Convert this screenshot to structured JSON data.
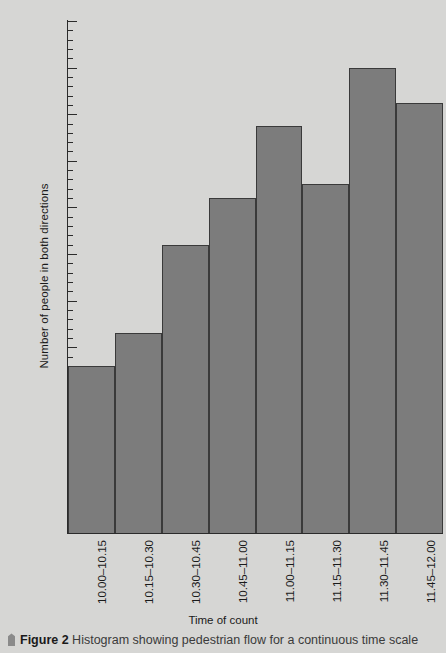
{
  "chart_data": {
    "type": "bar",
    "title": "",
    "xlabel": "Time of count",
    "ylabel": "Number of people in both directions",
    "categories": [
      "10.00–10.15",
      "10.15–10.30",
      "10.30–10.45",
      "10.45–11.00",
      "11.00–11.15",
      "11.15–11.30",
      "11.30–11.45",
      "11.45–12.00"
    ],
    "values": [
      126,
      133,
      152,
      162,
      177.5,
      165,
      190,
      182.5
    ],
    "ylim": [
      0,
      200
    ],
    "y_axis_break": true,
    "y_break_from": 0,
    "y_break_to": 100,
    "y_major_ticks": [
      0,
      100,
      110,
      120,
      130,
      140,
      150,
      160,
      170,
      180,
      190,
      200
    ],
    "y_minor_tick_step": 2,
    "grid": false,
    "legend": "none",
    "bar_color": "#7c7c7c",
    "bar_edge_color": "#3a3a3a",
    "background_color": "#d6d6d4",
    "axis_color": "#2b2b2b"
  },
  "axes": {
    "y_title": "Number of people in both directions",
    "x_title": "Time of count",
    "y_tick_labels": [
      "200",
      "190",
      "180",
      "170",
      "160",
      "150",
      "140",
      "130",
      "120",
      "110",
      "100",
      "0"
    ]
  },
  "caption": {
    "marker": "pin-icon",
    "figure_number": "Figure 2",
    "text": "Histogram showing pedestrian flow for a continuous time scale"
  }
}
